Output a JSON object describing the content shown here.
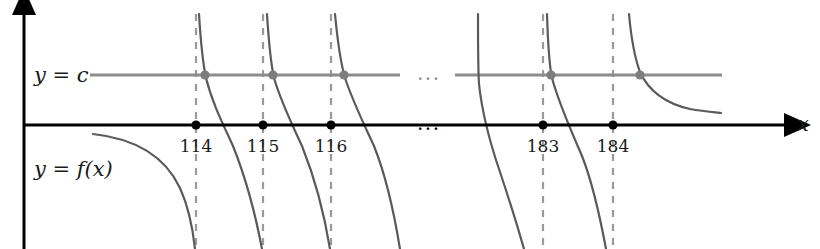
{
  "figure": {
    "kind": "mathematical-function-graph",
    "background_color": "#ffffff",
    "width": 820,
    "height": 249
  },
  "colors": {
    "axis": "#000000",
    "curve": "#5a5a5a",
    "level_line": "#8c8c8c",
    "dashed_asymptote": "#9a9a9a",
    "axis_dot": "#000000",
    "level_dot": "#7d7d7d",
    "text": "#1a1a1a"
  },
  "axes": {
    "x_axis": {
      "label": "x",
      "label_x": 797,
      "label_y": 131,
      "y_pixel": 125,
      "start_x": 24,
      "end_x": 787,
      "arrow": "right"
    },
    "y_axis": {
      "label": "",
      "x_pixel": 24,
      "start_y": 249,
      "end_y": 12,
      "arrow": "up"
    }
  },
  "labels": {
    "level_line": {
      "text": "y = c",
      "x": 34,
      "y": 82
    },
    "function": {
      "text": "y = f(x)",
      "x": 34,
      "y": 176
    }
  },
  "level_line": {
    "value_label": "c",
    "y_pixel": 75,
    "segments": [
      {
        "x1": 90,
        "x2": 400
      },
      {
        "x1": 455,
        "x2": 722
      }
    ]
  },
  "ellipsis": {
    "glyph": "...",
    "on_level_line": {
      "text": "...",
      "x": 417,
      "y": 80
    },
    "on_x_axis": {
      "text": "...",
      "x": 417,
      "y": 130
    }
  },
  "asymptotes": [
    {
      "label": "114",
      "x": 196,
      "dashed": true,
      "top_y": 14,
      "bottom_y": 249
    },
    {
      "label": "115",
      "x": 263,
      "dashed": true,
      "top_y": 14,
      "bottom_y": 249
    },
    {
      "label": "116",
      "x": 331,
      "dashed": true,
      "top_y": 14,
      "bottom_y": 249
    },
    {
      "label": "183",
      "x": 543,
      "dashed": true,
      "top_y": 14,
      "bottom_y": 249
    },
    {
      "label": "184",
      "x": 613,
      "dashed": true,
      "top_y": 14,
      "bottom_y": 249
    }
  ],
  "tick_labels": [
    {
      "text": "114",
      "x": 196,
      "y": 152
    },
    {
      "text": "115",
      "x": 263,
      "y": 152
    },
    {
      "text": "116",
      "x": 331,
      "y": 152
    },
    {
      "text": "183",
      "x": 543,
      "y": 152
    },
    {
      "text": "184",
      "x": 613,
      "y": 152
    }
  ],
  "axis_intersection_dots": [
    {
      "label": "114",
      "x": 196,
      "y": 125
    },
    {
      "label": "115",
      "x": 263,
      "y": 125
    },
    {
      "label": "116",
      "x": 331,
      "y": 125
    },
    {
      "label": "183",
      "x": 543,
      "y": 125
    },
    {
      "label": "184",
      "x": 613,
      "y": 125
    }
  ],
  "level_intersection_dots": [
    {
      "x": 205,
      "y": 75
    },
    {
      "x": 273,
      "y": 75
    },
    {
      "x": 344,
      "y": 75
    },
    {
      "x": 551,
      "y": 75
    },
    {
      "x": 640,
      "y": 75
    }
  ],
  "curve_branches": [
    {
      "name": "branch-left-partial",
      "path": "M 93 134 C 130 138 163 152 180 188 C 189 208 193 230 195 249"
    },
    {
      "name": "branch-114",
      "path": "M 199 14 C 201 46 203 64 206 78 C 212 102 222 122 233 146 C 245 176 255 212 262 249"
    },
    {
      "name": "branch-115",
      "path": "M 267 14 C 269 46 271 64 274 78 C 281 102 291 122 302 146 C 314 176 324 212 330 249"
    },
    {
      "name": "branch-116",
      "path": "M 335 14 C 338 46 341 64 345 78 C 353 102 363 122 374 146 C 386 176 394 212 400 249"
    },
    {
      "name": "branch-182-partial",
      "path": "M 478 14 C 478 48 478 68 479 84 C 482 112 489 140 500 172 C 510 202 518 228 524 249"
    },
    {
      "name": "branch-183",
      "path": "M 547 14 C 548 46 549 64 552 78 C 559 104 570 128 582 156 C 593 184 601 222 606 249"
    },
    {
      "name": "branch-184-decay",
      "path": "M 629 14 C 631 36 634 56 640 72 C 650 94 668 104 690 109 C 702 111 712 112 721 113"
    }
  ],
  "style_metrics": {
    "axis_stroke_width": 3,
    "curve_stroke_width": 2.2,
    "level_line_stroke_width": 3,
    "dashed_stroke_width": 2.2,
    "dash_pattern": "7 7",
    "axis_dot_radius": 4.6,
    "level_dot_radius": 4.6,
    "tick_label_font_size": 17,
    "math_label_font_size": 21,
    "ellipsis_font_size": 20
  }
}
